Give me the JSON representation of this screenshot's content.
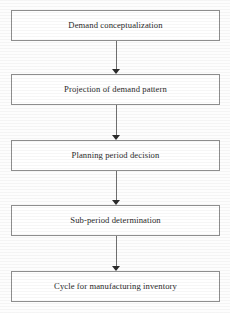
{
  "diagram": {
    "orientation": "vertical-top-to-bottom",
    "colors": {
      "background": "#fdfdfd",
      "node_fill": "#ffffff",
      "node_border": "#8e8e8e",
      "connector_line": "#6f6f6f",
      "arrowhead": "#2b2b2b",
      "text": "#2a2a2a"
    },
    "nodes": [
      {
        "id": "demand-conceptualization",
        "label": "Demand conceptualization",
        "top": 10
      },
      {
        "id": "projection-of-demand-pattern",
        "label": "Projection of demand pattern",
        "top": 74
      },
      {
        "id": "planning-period-decision",
        "label": "Planning period decision",
        "top": 140
      },
      {
        "id": "sub-period-determination",
        "label": "Sub-period determination",
        "top": 205
      },
      {
        "id": "cycle-for-manufacturing-inventory",
        "label": "Cycle for manufacturing inventory",
        "top": 271
      }
    ],
    "connectors": [
      {
        "id": "arrow-1",
        "from": "demand-conceptualization",
        "to": "projection-of-demand-pattern",
        "icon": "arrow-down-icon",
        "top": 41,
        "height": 33
      },
      {
        "id": "arrow-2",
        "from": "projection-of-demand-pattern",
        "to": "planning-period-decision",
        "icon": "arrow-down-icon",
        "top": 105,
        "height": 35
      },
      {
        "id": "arrow-3",
        "from": "planning-period-decision",
        "to": "sub-period-determination",
        "icon": "arrow-down-icon",
        "top": 171,
        "height": 34
      },
      {
        "id": "arrow-4",
        "from": "sub-period-determination",
        "to": "cycle-for-manufacturing-inventory",
        "icon": "arrow-down-icon",
        "top": 236,
        "height": 35
      }
    ]
  }
}
